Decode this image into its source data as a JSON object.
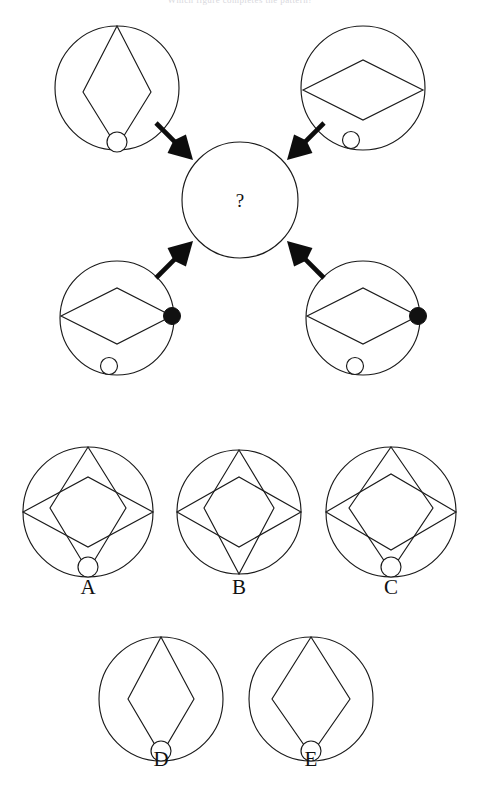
{
  "page": {
    "background_color": "#ffffff",
    "stroke_color": "#1a1a1a",
    "fill_color": "#111111",
    "width": 480,
    "height": 793,
    "cropped_header_text": "Which figure completes the pattern?"
  },
  "center": {
    "name": "center-unknown-circle",
    "symbol": "?",
    "cx": 240,
    "cy": 200,
    "r": 58
  },
  "stimuli": [
    {
      "id": "top-left",
      "label": "top-left-stimulus",
      "cx": 117,
      "cy": 88,
      "r": 62,
      "has_vertical_diamond": true,
      "has_horizontal_diamond": false,
      "bottom_open_circle": true,
      "right_filled_dot": false,
      "diamond_tip_in_circle": true
    },
    {
      "id": "top-right",
      "label": "top-right-stimulus",
      "cx": 363,
      "cy": 88,
      "r": 62,
      "has_vertical_diamond": false,
      "has_horizontal_diamond": true,
      "bottom_open_circle": true,
      "right_filled_dot": false,
      "diamond_tip_in_circle": false
    },
    {
      "id": "bottom-left",
      "label": "bottom-left-stimulus",
      "cx": 117,
      "cy": 318,
      "r": 57,
      "has_vertical_diamond": false,
      "has_horizontal_diamond": true,
      "bottom_open_circle": true,
      "right_filled_dot": true,
      "diamond_tip_in_circle": false
    },
    {
      "id": "bottom-right",
      "label": "bottom-right-stimulus",
      "cx": 363,
      "cy": 318,
      "r": 57,
      "has_vertical_diamond": false,
      "has_horizontal_diamond": true,
      "bottom_open_circle": true,
      "right_filled_dot": true,
      "diamond_tip_in_circle": false
    }
  ],
  "arrows": [
    {
      "id": "arrow-from-top-left",
      "from": "top-left",
      "to": "center",
      "direction": "down-right"
    },
    {
      "id": "arrow-from-top-right",
      "from": "top-right",
      "to": "center",
      "direction": "down-left"
    },
    {
      "id": "arrow-from-bottom-left",
      "from": "bottom-left",
      "to": "center",
      "direction": "up-right"
    },
    {
      "id": "arrow-from-bottom-right",
      "from": "bottom-right",
      "to": "center",
      "direction": "up-left"
    }
  ],
  "options": [
    {
      "id": "option-a",
      "label": "A",
      "cx": 88,
      "cy": 512,
      "r": 65,
      "label_x": 88,
      "label_y": 594,
      "has_vertical_diamond": true,
      "has_horizontal_diamond": true,
      "bottom_open_circle": true,
      "vertical_half_width": 38,
      "horizontal_half_height": 35
    },
    {
      "id": "option-b",
      "label": "B",
      "cx": 239,
      "cy": 512,
      "r": 62,
      "label_x": 239,
      "label_y": 594,
      "has_vertical_diamond": true,
      "has_horizontal_diamond": true,
      "bottom_open_circle": false,
      "vertical_half_width": 35,
      "horizontal_half_height": 35
    },
    {
      "id": "option-c",
      "label": "C",
      "cx": 391,
      "cy": 512,
      "r": 65,
      "label_x": 391,
      "label_y": 594,
      "has_vertical_diamond": true,
      "has_horizontal_diamond": true,
      "bottom_open_circle": true,
      "vertical_half_width": 42,
      "horizontal_half_height": 38
    },
    {
      "id": "option-d",
      "label": "D",
      "cx": 161,
      "cy": 699,
      "r": 62,
      "label_x": 161,
      "label_y": 766,
      "has_vertical_diamond": true,
      "has_horizontal_diamond": false,
      "bottom_open_circle": true,
      "vertical_half_width": 33,
      "horizontal_half_height": 0
    },
    {
      "id": "option-e",
      "label": "E",
      "cx": 311,
      "cy": 699,
      "r": 62,
      "label_x": 311,
      "label_y": 766,
      "has_vertical_diamond": true,
      "has_horizontal_diamond": false,
      "bottom_open_circle": true,
      "vertical_half_width": 39,
      "horizontal_half_height": 0
    }
  ]
}
